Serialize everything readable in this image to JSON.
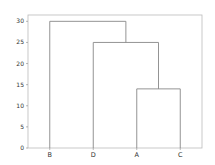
{
  "chart_data": {
    "type": "dendrogram",
    "title": "",
    "xlabel": "",
    "ylabel": "",
    "ylim": [
      0,
      31.5
    ],
    "yticks": [
      0,
      5,
      10,
      15,
      20,
      25,
      30
    ],
    "grid": false,
    "legend": null,
    "leaves": [
      "B",
      "D",
      "A",
      "C"
    ],
    "merges": [
      {
        "left": "A",
        "right": "C",
        "height": 14
      },
      {
        "left": "D",
        "right": "(A,C)",
        "height": 25
      },
      {
        "left": "B",
        "right": "(D,(A,C))",
        "height": 30
      }
    ],
    "line_color": "#888888"
  },
  "axis": {
    "yticks": [
      "0",
      "5",
      "10",
      "15",
      "20",
      "25",
      "30"
    ],
    "leaves": [
      "B",
      "D",
      "A",
      "C"
    ]
  }
}
